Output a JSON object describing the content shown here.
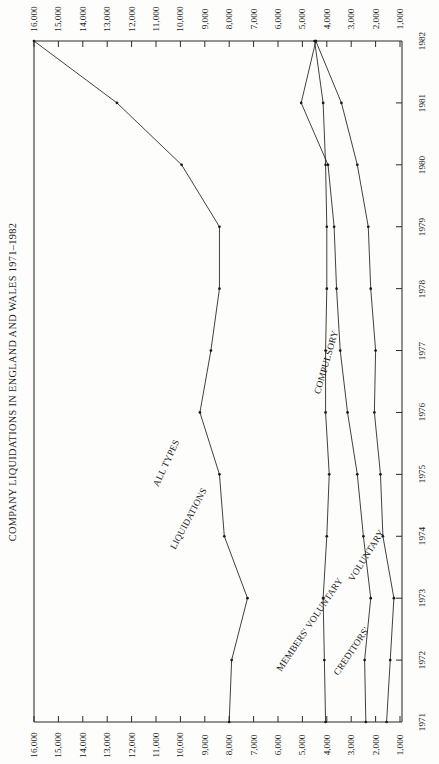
{
  "header": {
    "title": "COMPANY LIQUIDATIONS IN ENGLAND AND WALES 1971–1982"
  },
  "axes": {
    "value_axis_title": "",
    "value_ticks": [
      "16,000",
      "15,000",
      "14,000",
      "13,000",
      "12,000",
      "11,000",
      "10,000",
      "9,000",
      "8,000",
      "7,000",
      "6,000",
      "5,000",
      "4,000",
      "3,000",
      "2,000",
      "1,000"
    ],
    "value_ticks_numeric": [
      16000,
      15000,
      14000,
      13000,
      12000,
      11000,
      10000,
      9000,
      8000,
      7000,
      6000,
      5000,
      4000,
      3000,
      2000,
      1000
    ],
    "year_ticks": [
      "1982",
      "1981",
      "1980",
      "1979",
      "1978",
      "1977",
      "1976",
      "1975",
      "1974",
      "1973",
      "1972",
      "1971"
    ]
  },
  "series_labels": {
    "all_types": "ALL TYPES",
    "liquidations": "LIQUIDATIONS",
    "members_voluntary": "MEMBERS' VOLUNTARY",
    "creditors": "CREDITORS'",
    "voluntary": "VOLUNTARY",
    "compulsory": "COMPULSORY"
  },
  "chart_data": {
    "type": "line",
    "orientation": "rotated-90",
    "title": "COMPANY LIQUIDATIONS IN ENGLAND AND WALES 1971–1982",
    "xlabel": "",
    "ylabel": "",
    "grid": false,
    "legend": "inline-curve-labels",
    "x": [
      1971,
      1972,
      1973,
      1974,
      1975,
      1976,
      1977,
      1978,
      1979,
      1980,
      1981,
      1982
    ],
    "xlim": [
      1971,
      1982
    ],
    "ylim": [
      0,
      16000
    ],
    "yticks": [
      1000,
      2000,
      3000,
      4000,
      5000,
      6000,
      7000,
      8000,
      9000,
      10000,
      11000,
      12000,
      13000,
      14000,
      15000,
      16000
    ],
    "series": [
      {
        "name": "ALL TYPES LIQUIDATIONS",
        "values": [
          8000,
          7900,
          7250,
          8200,
          8400,
          9200,
          8750,
          8400,
          8400,
          9950,
          12600,
          16000
        ]
      },
      {
        "name": "MEMBERS' VOLUNTARY",
        "values": [
          4050,
          4100,
          4150,
          4000,
          3900,
          4050,
          4050,
          4000,
          4000,
          4050,
          4150,
          4500
        ]
      },
      {
        "name": "CREDITORS' VOLUNTARY",
        "values": [
          2400,
          2450,
          2200,
          2500,
          2750,
          3150,
          3450,
          3600,
          3700,
          3950,
          5050,
          4450
        ]
      },
      {
        "name": "COMPULSORY",
        "values": [
          1550,
          1400,
          1250,
          1700,
          1800,
          2050,
          2000,
          2200,
          2300,
          2750,
          3400,
          4450
        ]
      }
    ]
  }
}
